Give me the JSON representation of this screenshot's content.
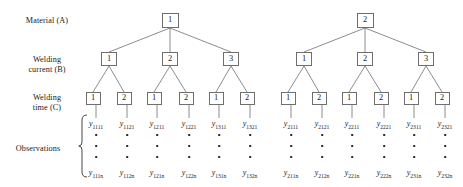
{
  "figure": {
    "type": "hierarchical-nested-design-tree",
    "background": "#ffffff",
    "line_color": "#6e6e6e",
    "text_color": "#1a1a1a"
  },
  "row_labels": [
    {
      "id": "material",
      "text": "Material (A)",
      "x": 47,
      "y": 16
    },
    {
      "id": "welding-current",
      "text": "Welding\ncurrent (B)",
      "x": 47,
      "y": 55
    },
    {
      "id": "welding-time",
      "text": "Welding\ntime (C)",
      "x": 47,
      "y": 93
    },
    {
      "id": "observations",
      "text": "Observations",
      "x": 38,
      "y": 144
    }
  ],
  "levels": {
    "level1": {
      "name": "Material (A)",
      "y": 13
    },
    "level2": {
      "name": "Welding current (B)",
      "y": 52
    },
    "level3": {
      "name": "Welding time (C)",
      "y": 92
    }
  },
  "nodes_level1": [
    {
      "label": "1",
      "x": 170,
      "y": 13
    },
    {
      "label": "2",
      "x": 365,
      "y": 13
    }
  ],
  "nodes_level2": [
    {
      "label": "1",
      "x": 109,
      "y": 52,
      "parent": 0
    },
    {
      "label": "2",
      "x": 170,
      "y": 52,
      "parent": 0
    },
    {
      "label": "3",
      "x": 231,
      "y": 52,
      "parent": 0
    },
    {
      "label": "1",
      "x": 304,
      "y": 52,
      "parent": 1
    },
    {
      "label": "2",
      "x": 365,
      "y": 52,
      "parent": 1
    },
    {
      "label": "3",
      "x": 426,
      "y": 52,
      "parent": 1
    }
  ],
  "nodes_level3": [
    {
      "label": "1",
      "x": 93,
      "y": 92,
      "parent": 0
    },
    {
      "label": "2",
      "x": 124,
      "y": 92,
      "parent": 0
    },
    {
      "label": "1",
      "x": 154,
      "y": 92,
      "parent": 1
    },
    {
      "label": "2",
      "x": 186,
      "y": 92,
      "parent": 1
    },
    {
      "label": "1",
      "x": 216,
      "y": 92,
      "parent": 2
    },
    {
      "label": "2",
      "x": 247,
      "y": 92,
      "parent": 2
    },
    {
      "label": "1",
      "x": 288,
      "y": 92,
      "parent": 3
    },
    {
      "label": "2",
      "x": 319,
      "y": 92,
      "parent": 3
    },
    {
      "label": "1",
      "x": 349,
      "y": 92,
      "parent": 4
    },
    {
      "label": "2",
      "x": 381,
      "y": 92,
      "parent": 4
    },
    {
      "label": "1",
      "x": 411,
      "y": 92,
      "parent": 5
    },
    {
      "label": "2",
      "x": 442,
      "y": 92,
      "parent": 5
    }
  ],
  "observation_columns": [
    {
      "x": 96,
      "symbol": "y",
      "first": "1111",
      "last": "111n"
    },
    {
      "x": 127,
      "symbol": "y",
      "first": "1121",
      "last": "112n"
    },
    {
      "x": 157,
      "symbol": "y",
      "first": "1211",
      "last": "121n"
    },
    {
      "x": 189,
      "symbol": "y",
      "first": "1221",
      "last": "122n"
    },
    {
      "x": 219,
      "symbol": "y",
      "first": "1311",
      "last": "131n"
    },
    {
      "x": 250,
      "symbol": "y",
      "first": "1321",
      "last": "132n"
    },
    {
      "x": 291,
      "symbol": "y",
      "first": "2111",
      "last": "211n"
    },
    {
      "x": 322,
      "symbol": "y",
      "first": "2121",
      "last": "212n"
    },
    {
      "x": 352,
      "symbol": "y",
      "first": "2211",
      "last": "221n"
    },
    {
      "x": 384,
      "symbol": "y",
      "first": "2221",
      "last": "222n"
    },
    {
      "x": 414,
      "symbol": "y",
      "first": "2311",
      "last": "231n"
    },
    {
      "x": 445,
      "symbol": "y",
      "first": "2321",
      "last": "232n"
    }
  ],
  "observation_rows": {
    "first_row_y": 120,
    "dot_rows_y": [
      134,
      145,
      156
    ],
    "last_row_y": 169,
    "ellipsis_dot_count": 3
  },
  "brace": {
    "symbol": "{",
    "x": 78,
    "top": 114,
    "bottom": 178
  }
}
